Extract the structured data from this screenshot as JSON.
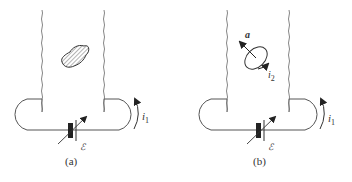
{
  "figures": [
    {
      "id": "a",
      "caption": "(a)",
      "current_label": "i",
      "current_subscript": "1",
      "source_label": "ℰ",
      "object": "irregular-hatched-body"
    },
    {
      "id": "b",
      "caption": "(b)",
      "current_label": "i",
      "current_subscript": "1",
      "loop_current_label": "i",
      "loop_current_subscript": "2",
      "vector_label": "a",
      "source_label": "ℰ",
      "object": "current-loop-with-axis"
    }
  ],
  "colors": {
    "line": "#555555",
    "stroke_dark": "#222222",
    "background": "#ffffff"
  }
}
